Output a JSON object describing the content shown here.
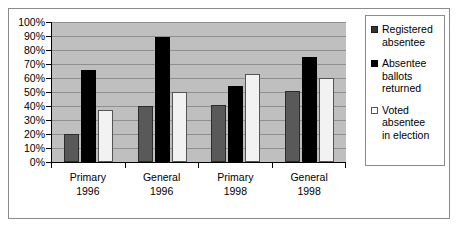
{
  "chart_data": {
    "type": "bar",
    "title": "",
    "subtitle": "",
    "xlabel": "",
    "ylabel": "",
    "ylim": [
      0,
      100
    ],
    "grid": true,
    "legend_position": "right",
    "categories": [
      {
        "line1": "Primary",
        "line2": "1996"
      },
      {
        "line1": "General",
        "line2": "1996"
      },
      {
        "line1": "Primary",
        "line2": "1998"
      },
      {
        "line1": "General",
        "line2": "1998"
      }
    ],
    "y_ticks": [
      "100%",
      "90%",
      "80%",
      "70%",
      "60%",
      "50%",
      "40%",
      "30%",
      "20%",
      "10%",
      "0%"
    ],
    "y_tick_values": [
      100,
      90,
      80,
      70,
      60,
      50,
      40,
      30,
      20,
      10,
      0
    ],
    "series": [
      {
        "name": "Registered absentee",
        "legend_lines": [
          "Registered",
          "absentee"
        ],
        "color": "#595959",
        "values": [
          20,
          40,
          41,
          51
        ]
      },
      {
        "name": "Absentee ballots returned",
        "legend_lines": [
          "Absentee",
          "ballots",
          "returned"
        ],
        "color": "#000000",
        "values": [
          66,
          89,
          54,
          75
        ]
      },
      {
        "name": "Voted absentee in election",
        "legend_lines": [
          "Voted",
          "absentee",
          "in election"
        ],
        "color": "#f2f2f2",
        "values": [
          37,
          50,
          63,
          60
        ]
      }
    ]
  },
  "colors": {
    "plot_background": "#bfbfbf",
    "gridline": "#8f8f8f",
    "axis": "#000000",
    "frame_border": "#8c8c8c",
    "page_background": "#ffffff"
  }
}
